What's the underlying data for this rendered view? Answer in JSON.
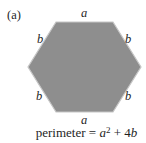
{
  "figure": {
    "label": "(a)",
    "hexagon": {
      "fill_color": "#8e8e8e",
      "stroke_color": "#c6c6c6",
      "top_side_label": "a",
      "bottom_side_label": "a",
      "side_labels": {
        "top_left": "b",
        "top_right": "b",
        "bottom_left": "b",
        "bottom_right": "b"
      }
    },
    "formula": {
      "prefix": "perimeter = ",
      "term1_var": "a",
      "term1_exponent": "2",
      "operator": " + ",
      "term2_coefficient": "4",
      "term2_var": "b"
    }
  }
}
